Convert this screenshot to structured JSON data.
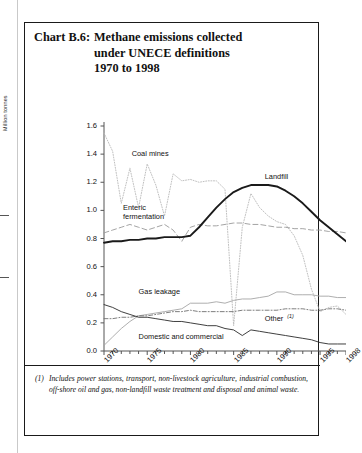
{
  "title": {
    "chart_number": "Chart B.6:",
    "lines": [
      "Methane emissions collected",
      "under UNECE definitions",
      "1970 to 1998"
    ]
  },
  "footnote": {
    "marker": "(1)",
    "text": "Includes power stations, transport, non-livestock agriculture, industrial combustion, off-shore oil and gas, non-landfill waste treatment and disposal and animal waste."
  },
  "chart_data": {
    "type": "line",
    "title": "Methane emissions collected under UNECE definitions 1970 to 1998",
    "xlabel": "",
    "ylabel": "Million tonnes",
    "xlim": [
      1970,
      1998
    ],
    "ylim": [
      0.0,
      1.6
    ],
    "grid": false,
    "legend": "inline-annotations",
    "ytick_labels": [
      "0.0",
      "0.2",
      "0.4",
      "0.6",
      "0.8",
      "1.0",
      "1.2",
      "1.4",
      "1.6"
    ],
    "ytick_values": [
      0.0,
      0.2,
      0.4,
      0.6,
      0.8,
      1.0,
      1.2,
      1.4,
      1.6
    ],
    "xtick_labels": [
      "1970",
      "1975",
      "1980",
      "1985",
      "1990",
      "1995",
      "1998"
    ],
    "xtick_values": [
      1970,
      1975,
      1980,
      1985,
      1990,
      1995,
      1998
    ],
    "x": [
      1970,
      1971,
      1972,
      1973,
      1974,
      1975,
      1976,
      1977,
      1978,
      1979,
      1980,
      1981,
      1982,
      1983,
      1984,
      1985,
      1986,
      1987,
      1988,
      1989,
      1990,
      1991,
      1992,
      1993,
      1994,
      1995,
      1996,
      1997,
      1998
    ],
    "series": [
      {
        "name": "Coal mines",
        "style": "dotted",
        "color": "#b9b9b9",
        "label_x": 1973.2,
        "label_y": 1.4,
        "values": [
          1.55,
          1.42,
          1.05,
          1.3,
          1.02,
          1.33,
          1.18,
          0.96,
          1.26,
          1.21,
          1.22,
          1.2,
          1.21,
          1.21,
          1.15,
          0.18,
          0.88,
          1.12,
          1.02,
          0.96,
          0.92,
          0.9,
          0.82,
          0.68,
          0.44,
          0.28,
          0.31,
          0.32,
          0.26
        ]
      },
      {
        "name": "Enteric fermentation",
        "style": "dashed",
        "color": "#9a9a9a",
        "label_x": 1972.2,
        "label_y": 1.02,
        "values": [
          0.84,
          0.86,
          0.88,
          0.9,
          0.88,
          0.86,
          0.88,
          0.9,
          0.86,
          0.78,
          0.88,
          0.9,
          0.89,
          0.89,
          0.9,
          0.91,
          0.91,
          0.9,
          0.9,
          0.89,
          0.88,
          0.88,
          0.87,
          0.87,
          0.86,
          0.86,
          0.85,
          0.85,
          0.84
        ]
      },
      {
        "name": "Landfill",
        "style": "solid-thick",
        "color": "#1a1a1a",
        "label_x": 1988.6,
        "label_y": 1.24,
        "values": [
          0.77,
          0.78,
          0.78,
          0.79,
          0.79,
          0.8,
          0.8,
          0.81,
          0.81,
          0.81,
          0.82,
          0.88,
          0.95,
          1.02,
          1.08,
          1.13,
          1.16,
          1.18,
          1.18,
          1.18,
          1.17,
          1.14,
          1.1,
          1.05,
          0.99,
          0.93,
          0.88,
          0.83,
          0.78
        ]
      },
      {
        "name": "Gas leakage",
        "style": "solid-light",
        "color": "#a5a5a5",
        "label_x": 1974.0,
        "label_y": 0.42,
        "values": [
          0.04,
          0.1,
          0.16,
          0.21,
          0.25,
          0.26,
          0.27,
          0.28,
          0.29,
          0.3,
          0.34,
          0.34,
          0.34,
          0.35,
          0.34,
          0.36,
          0.37,
          0.37,
          0.38,
          0.39,
          0.42,
          0.42,
          0.4,
          0.4,
          0.4,
          0.39,
          0.39,
          0.38,
          0.38
        ]
      },
      {
        "name": "Other",
        "footnote_ref": "(1)",
        "style": "dash-dot",
        "color": "#6f6f6f",
        "label_x": 1988.6,
        "label_y": 0.245,
        "values": [
          0.23,
          0.23,
          0.24,
          0.24,
          0.25,
          0.25,
          0.26,
          0.27,
          0.28,
          0.28,
          0.29,
          0.28,
          0.28,
          0.28,
          0.28,
          0.28,
          0.29,
          0.29,
          0.29,
          0.29,
          0.29,
          0.3,
          0.3,
          0.3,
          0.29,
          0.29,
          0.3,
          0.3,
          0.29
        ]
      },
      {
        "name": "Domestic and commercial",
        "style": "solid-thin",
        "color": "#2a2a2a",
        "label_x": 1974.0,
        "label_y": 0.1,
        "values": [
          0.33,
          0.31,
          0.28,
          0.26,
          0.24,
          0.24,
          0.23,
          0.22,
          0.21,
          0.21,
          0.2,
          0.19,
          0.18,
          0.18,
          0.16,
          0.15,
          0.11,
          0.15,
          0.14,
          0.13,
          0.12,
          0.11,
          0.1,
          0.09,
          0.08,
          0.06,
          0.05,
          0.05,
          0.05
        ]
      }
    ]
  }
}
